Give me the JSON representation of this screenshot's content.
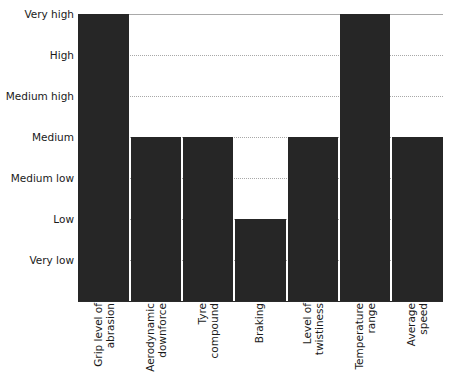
{
  "chart_data": {
    "type": "bar",
    "title": "",
    "subtitle": "",
    "xlabel": "",
    "ylabel": "",
    "orientation": "vertical",
    "grid": true,
    "legend": null,
    "legend_position": "none",
    "bar_color": "#262626",
    "gridline_color": "#bdbdbd",
    "background_color": "#ffffff",
    "y_scale": "ordinal",
    "y_tick_labels": [
      "Very high",
      "High",
      "Medium high",
      "Medium",
      "Medium low",
      "Low",
      "Very low"
    ],
    "y_levels_bottom_to_top": [
      "Very low",
      "Low",
      "Medium low",
      "Medium",
      "Medium high",
      "High",
      "Very high"
    ],
    "categories": [
      "Grip level of abrasion",
      "Aerodynamic downforce",
      "Tyre compound",
      "Braking",
      "Level of twistiness",
      "Temperature range",
      "Average speed"
    ],
    "category_label_lines": [
      [
        "Grip level of",
        "abrasion"
      ],
      [
        "Aerodynamic",
        "downforce"
      ],
      [
        "Tyre",
        "compound"
      ],
      [
        "Braking"
      ],
      [
        "Level of",
        "twistiness"
      ],
      [
        "Temperature",
        "range"
      ],
      [
        "Average",
        "speed"
      ]
    ],
    "values": [
      "Very high",
      "Medium",
      "Medium",
      "Low",
      "Medium",
      "Very high",
      "Medium"
    ],
    "values_numeric": [
      7,
      4,
      4,
      2,
      4,
      7,
      4
    ],
    "ylim": [
      0,
      7
    ]
  }
}
